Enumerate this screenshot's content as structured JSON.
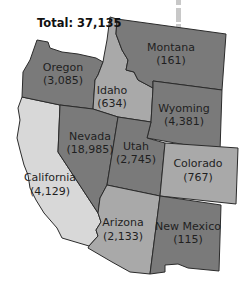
{
  "title": "Total: 37,135",
  "colors": {
    "dark": "#7a7a7a",
    "medium": "#a9a9a9",
    "light": "#d8d8d8",
    "border": "#2b2b2b"
  },
  "states": [
    {
      "name": "Oregon",
      "value": "(3,085)",
      "count": 3085,
      "shade": "dark"
    },
    {
      "name": "Idaho",
      "value": "(634)",
      "count": 634,
      "shade": "medium"
    },
    {
      "name": "Montana",
      "value": "(161)",
      "count": 161,
      "shade": "dark"
    },
    {
      "name": "Wyoming",
      "value": "(4,381)",
      "count": 4381,
      "shade": "dark"
    },
    {
      "name": "Nevada",
      "value": "(18,985)",
      "count": 18985,
      "shade": "dark"
    },
    {
      "name": "Utah",
      "value": "(2,745)",
      "count": 2745,
      "shade": "dark"
    },
    {
      "name": "Colorado",
      "value": "(767)",
      "count": 767,
      "shade": "medium"
    },
    {
      "name": "California",
      "value": "(4,129)",
      "count": 4129,
      "shade": "light"
    },
    {
      "name": "Arizona",
      "value": "(2,133)",
      "count": 2133,
      "shade": "medium"
    },
    {
      "name": "New Mexico",
      "value": "(115)",
      "count": 115,
      "shade": "dark"
    }
  ]
}
